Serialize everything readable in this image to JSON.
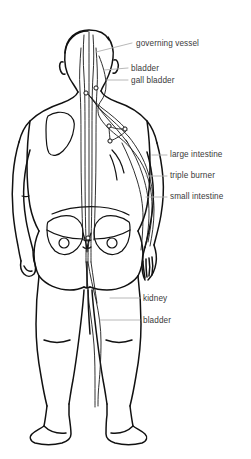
{
  "figure": {
    "view": "back",
    "background_color": "#ffffff",
    "outline_color": "#111111",
    "meridian_color": "#1a1a1a",
    "leader_color": "#b0b0b0",
    "text_color": "#3a3a3a"
  },
  "labels": [
    {
      "id": "governing-vessel",
      "text": "governing vessel",
      "x": 136,
      "y": 39,
      "leader": {
        "x1": 96,
        "y1": 52,
        "x2": 132,
        "y2": 43
      }
    },
    {
      "id": "bladder",
      "text": "bladder",
      "x": 131,
      "y": 64,
      "leader": {
        "x1": 104,
        "y1": 70,
        "x2": 128,
        "y2": 68
      }
    },
    {
      "id": "gall-bladder",
      "text": "gall bladder",
      "x": 131,
      "y": 76,
      "leader": {
        "x1": 106,
        "y1": 80,
        "x2": 128,
        "y2": 80
      }
    },
    {
      "id": "large-intestine",
      "text": "large intestine",
      "x": 170,
      "y": 150,
      "leader": {
        "x1": 152,
        "y1": 155,
        "x2": 167,
        "y2": 155
      }
    },
    {
      "id": "triple-burner",
      "text": "triple burner",
      "x": 170,
      "y": 171,
      "leader": {
        "x1": 146,
        "y1": 176,
        "x2": 167,
        "y2": 176
      }
    },
    {
      "id": "small-intestine",
      "text": "small intestine",
      "x": 170,
      "y": 192,
      "leader": {
        "x1": 146,
        "y1": 197,
        "x2": 167,
        "y2": 197
      }
    },
    {
      "id": "kidney",
      "text": "kidney",
      "x": 143,
      "y": 294,
      "leader": {
        "x1": 110,
        "y1": 298,
        "x2": 140,
        "y2": 298
      }
    },
    {
      "id": "bladder-lower",
      "text": "bladder",
      "x": 143,
      "y": 316,
      "leader": {
        "x1": 100,
        "y1": 320,
        "x2": 140,
        "y2": 320
      }
    }
  ],
  "acupoints": [
    {
      "id": "point-neck-left",
      "cx": 86,
      "cy": 93
    },
    {
      "id": "point-neck-right",
      "cx": 96,
      "cy": 88
    },
    {
      "id": "point-scapula",
      "cx": 109,
      "cy": 126
    },
    {
      "id": "point-mid-back",
      "cx": 110,
      "cy": 141
    },
    {
      "id": "point-shoulder",
      "cx": 125,
      "cy": 129
    },
    {
      "id": "point-sacrum",
      "cx": 88,
      "cy": 238
    }
  ]
}
